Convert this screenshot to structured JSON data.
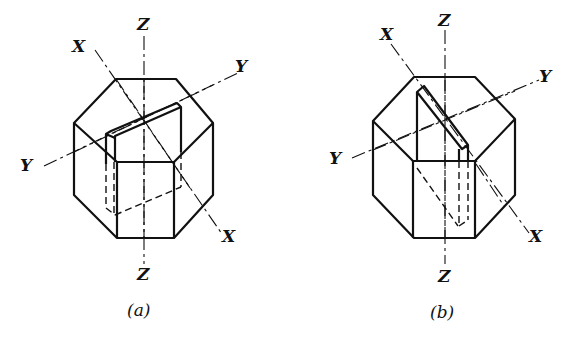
{
  "figures": [
    {
      "id": "a",
      "caption": "(a)",
      "axes": {
        "z_top": "Z",
        "z_bottom": "Z",
        "x_top": "X",
        "x_bottom": "X",
        "y_left": "Y",
        "y_right": "Y"
      },
      "description": "Hexagonal prism with a thin plate cut parallel to the Y axis"
    },
    {
      "id": "b",
      "caption": "(b)",
      "axes": {
        "z_top": "Z",
        "z_bottom": "Z",
        "x_top": "X",
        "x_bottom": "X",
        "y_left": "Y",
        "y_right": "Y"
      },
      "description": "Hexagonal prism with a thin plate cut parallel to the X axis"
    }
  ]
}
